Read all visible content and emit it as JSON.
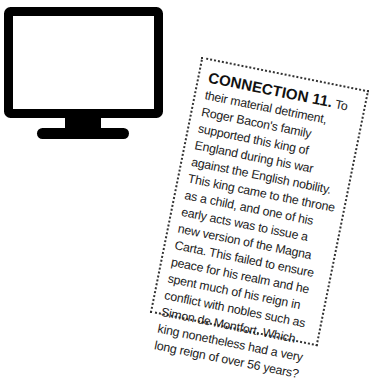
{
  "illustration": {
    "icon": "monitor-icon",
    "color": "#000000"
  },
  "card": {
    "title": "CONNECTION 11.",
    "body": " To their material detriment, Roger Bacon's family supported this king of England during his war against the English nobility. This king came to the throne as a child, and one of his early acts was to issue a new version of the Magna Carta. This failed to ensure peace for his realm and he spent much of his reign in conflict with nobles such as Simon de Montfort. Which king nonetheless had a very long reign of over 56 years?"
  }
}
